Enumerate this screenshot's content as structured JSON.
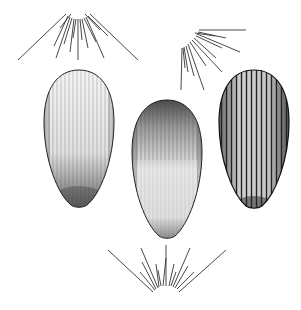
{
  "figure": {
    "background": "#ffffff",
    "ink": "#1a1a1a",
    "seeds": [
      {
        "id": "left",
        "cx": 79,
        "top": 70,
        "bottom": 207,
        "width": 70,
        "texture": "stippled",
        "dark_end": "bottom"
      },
      {
        "id": "middle",
        "cx": 167,
        "top": 100,
        "bottom": 238,
        "width": 70,
        "texture": "stippled-ribbed",
        "dark_end": "top"
      },
      {
        "id": "right",
        "cx": 254,
        "top": 70,
        "bottom": 208,
        "width": 70,
        "texture": "ribbed",
        "dark_end": "both"
      }
    ],
    "pappus": [
      {
        "id": "top-left",
        "cx": 78,
        "cy": 14,
        "direction": "down-fan"
      },
      {
        "id": "top-right",
        "cx": 198,
        "cy": 30,
        "direction": "down-right-fan"
      },
      {
        "id": "bottom",
        "cx": 166,
        "cy": 293,
        "direction": "up-fan"
      }
    ]
  }
}
